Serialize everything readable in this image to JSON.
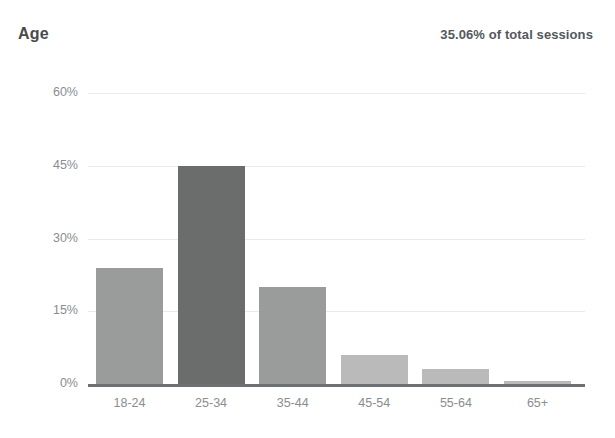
{
  "header": {
    "title": "Age",
    "summary": "35.06% of total sessions"
  },
  "colors": {
    "bar_default": "#9a9b9b",
    "bar_highlight": "#6b6c6c",
    "bar_light": "#b9bab9",
    "gridline": "#e8eaec",
    "axis": "#6e7173",
    "label_text": "#8a8d90",
    "title_text": "#4a4a4a",
    "summary_text": "#54585c",
    "background": "#ffffff"
  },
  "chart_data": {
    "type": "bar",
    "title": "Age",
    "subtitle": "35.06% of total sessions",
    "xlabel": "",
    "ylabel": "",
    "categories": [
      "18-24",
      "25-34",
      "35-44",
      "45-54",
      "55-64",
      "65+"
    ],
    "values": [
      24,
      45,
      20,
      6,
      3,
      0.6
    ],
    "value_labels": [
      "24%",
      "45%",
      "20%",
      "6%",
      "3%",
      "0.6%"
    ],
    "ylim": [
      0,
      60
    ],
    "yticks": [
      0,
      15,
      30,
      45,
      60
    ],
    "ytick_labels": [
      "0%",
      "15%",
      "30%",
      "45%",
      "60%"
    ],
    "grid": true,
    "legend": false,
    "highlight_index": 1,
    "bar_colors": [
      "#9a9b9b",
      "#6b6c6c",
      "#9a9b9b",
      "#b9bab9",
      "#b9bab9",
      "#b9bab9"
    ]
  }
}
